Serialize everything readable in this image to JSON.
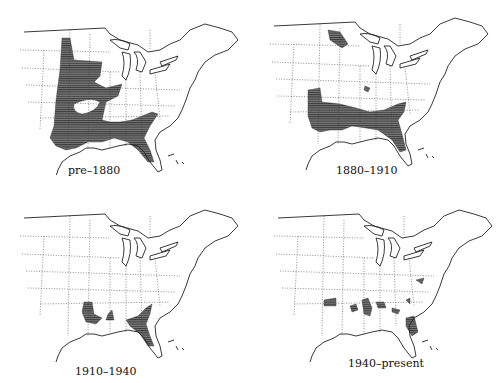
{
  "figure": {
    "type": "historical range maps",
    "region": "Eastern United States",
    "shading_color": "#555555",
    "panels": [
      {
        "label": "pre–1880",
        "description": "broad range across central and southern states, west to plains"
      },
      {
        "label": "1880–1910",
        "description": "range restricted to Gulf states and Florida, small northern patch"
      },
      {
        "label": "1910–1940",
        "description": "range restricted to coastal Louisiana, Gulf coast and Florida"
      },
      {
        "label": "1940–present",
        "description": "scattered small patches along Gulf coast, Florida and Carolinas"
      }
    ]
  }
}
